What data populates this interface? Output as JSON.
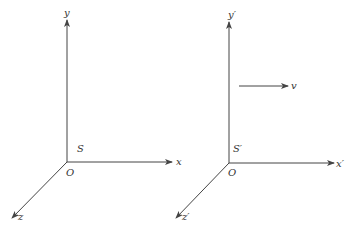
{
  "diagram": {
    "type": "two-reference-frames",
    "frames": [
      {
        "name": "S",
        "frame_label": "S",
        "origin_label": "O",
        "axes": {
          "x": "x",
          "y": "y",
          "z": "z"
        }
      },
      {
        "name": "S'",
        "frame_label": "S′",
        "origin_label": "O",
        "axes": {
          "x": "x′",
          "y": "y′",
          "z": "z′"
        }
      }
    ],
    "velocity": {
      "label": "v",
      "direction": "+x"
    },
    "colors": {
      "line": "#444444",
      "text": "#333333",
      "background": "#ffffff"
    }
  }
}
